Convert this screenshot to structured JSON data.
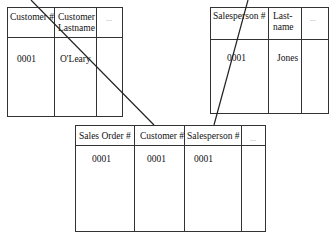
{
  "customer_table": {
    "headers": [
      "Customer #",
      "Customer Lastname",
      "..."
    ],
    "rows": [
      [
        "0001",
        "O'Leary",
        ""
      ]
    ]
  },
  "salesperson_table": {
    "headers": [
      "Salesperson #",
      "Last-name",
      "..."
    ],
    "rows": [
      [
        "0001",
        "Jones",
        ""
      ]
    ]
  },
  "sales_order_table": {
    "headers": [
      "Sales Order #",
      "Customer #",
      "Salesperson #",
      "..."
    ],
    "rows": [
      [
        "0001",
        "0001",
        "0001",
        ""
      ]
    ]
  },
  "relationships": [
    {
      "from": "customer_table.Customer #",
      "to": "sales_order_table.Customer #"
    },
    {
      "from": "salesperson_table.Salesperson #",
      "to": "sales_order_table.Salesperson #"
    }
  ]
}
